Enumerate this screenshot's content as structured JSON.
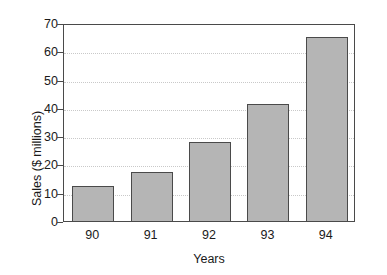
{
  "chart_data": {
    "type": "bar",
    "title": "",
    "subtitle": "",
    "xlabel": "Years",
    "ylabel": "Sales ($ millions)",
    "categories": [
      "90",
      "91",
      "92",
      "93",
      "94"
    ],
    "values": [
      12.3,
      17.5,
      28.0,
      41.5,
      65.0
    ],
    "series": [
      {
        "name": "Sales",
        "values": [
          12.3,
          17.5,
          28.0,
          41.5,
          65.0
        ]
      }
    ],
    "ylim": [
      0,
      70
    ],
    "ytick_labels": [
      "0",
      "10",
      "20",
      "30",
      "40",
      "50",
      "60",
      "70"
    ],
    "ytick_values": [
      0,
      10,
      20,
      30,
      40,
      50,
      60,
      70
    ],
    "ytick_step": 10,
    "grid": true,
    "grid_axis": "y",
    "grid_style": "dotted",
    "gridline_values": [
      10,
      20,
      30,
      40,
      50,
      60
    ],
    "legend": false,
    "legend_position": "none",
    "bar_fill_color": "#b5b5b5",
    "bar_border_color": "#4a4a4a",
    "gridline_color": "#c9c9c9",
    "axis_color": "#4a4a4a",
    "background_color": "#ffffff",
    "text_color": "#1a1a1a"
  }
}
